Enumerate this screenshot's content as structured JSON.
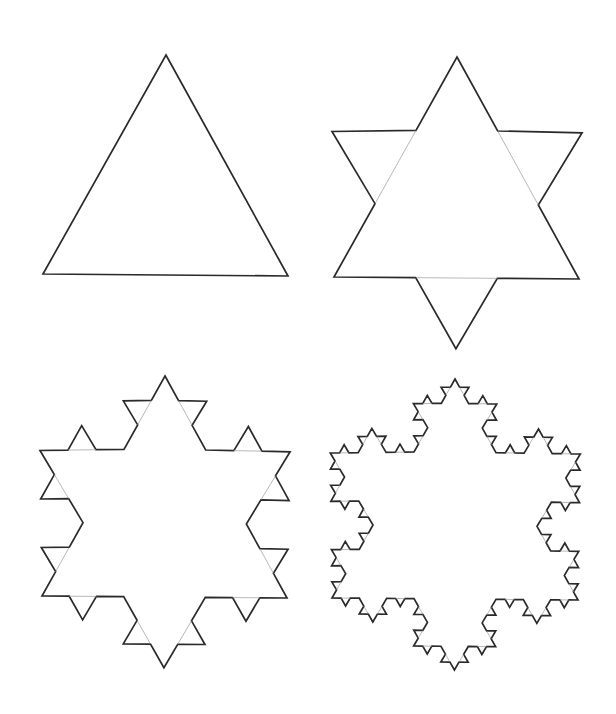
{
  "figure": {
    "title": "",
    "colors": {
      "background": "#ffffff",
      "outline": "#2a2a2a",
      "guide": "#9a9a9a"
    },
    "panels": [
      {
        "name": "koch-iteration-0",
        "iteration": 0,
        "triangle": [
          [
            166,
            55
          ],
          [
            288,
            276
          ],
          [
            43,
            274
          ]
        ]
      },
      {
        "name": "koch-iteration-1",
        "iteration": 1,
        "triangle": [
          [
            457,
            57
          ],
          [
            579,
            279
          ],
          [
            334,
            277
          ]
        ]
      },
      {
        "name": "koch-iteration-2",
        "iteration": 2,
        "triangle": [
          [
            165,
            376
          ],
          [
            287,
            598
          ],
          [
            42,
            596
          ]
        ]
      },
      {
        "name": "koch-iteration-3",
        "iteration": 3,
        "triangle": [
          [
            455,
            379
          ],
          [
            578,
            600
          ],
          [
            332,
            598
          ]
        ]
      }
    ]
  }
}
